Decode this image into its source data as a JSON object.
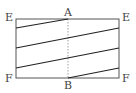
{
  "diagram": {
    "labels": {
      "top_left": "E",
      "top_middle": "A",
      "top_right": "E",
      "bottom_left": "F",
      "bottom_middle": "B",
      "bottom_right": "F"
    },
    "rectangle": {
      "x1": 16,
      "y1": 19,
      "x2": 119,
      "y2": 78
    },
    "dashed_line": {
      "x": 68,
      "y1": 19,
      "y2": 78,
      "from": "A",
      "to": "B"
    },
    "diagonal_lines": [
      {
        "x1": 16,
        "y1": 28,
        "x2": 68,
        "y2": 19
      },
      {
        "x1": 16,
        "y1": 48,
        "x2": 119,
        "y2": 28
      },
      {
        "x1": 16,
        "y1": 68,
        "x2": 119,
        "y2": 48
      },
      {
        "x1": 68,
        "y1": 78,
        "x2": 119,
        "y2": 68
      }
    ],
    "colors": {
      "stroke": "#222222",
      "rect_stroke": "#555555",
      "dashed": "#888888",
      "label": "#444444"
    }
  }
}
